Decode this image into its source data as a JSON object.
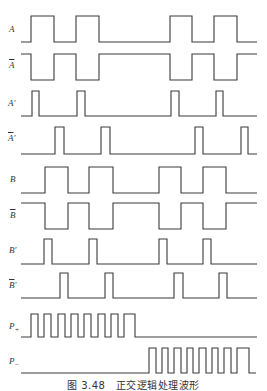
{
  "figure": {
    "caption": "图 3.48　正交逻辑处理波形",
    "stroke_color": "#3a3a3a",
    "background": "#ffffff"
  },
  "signals": [
    {
      "id": "A",
      "label": "A",
      "overline": false,
      "prime": "",
      "label_x": 9,
      "label_y": 25,
      "x_start": 21,
      "x_end": 257,
      "y_high": 16,
      "y_low": 42,
      "idle": "low",
      "pulses": [
        [
          31,
          54
        ],
        [
          76,
          99
        ],
        [
          170,
          192
        ],
        [
          214,
          237
        ]
      ]
    },
    {
      "id": "A_bar",
      "label": "A",
      "overline": true,
      "prime": "",
      "label_x": 9,
      "label_y": 61,
      "x_start": 21,
      "x_end": 257,
      "y_high": 54,
      "y_low": 80,
      "idle": "high",
      "pulses": [
        [
          31,
          54
        ],
        [
          76,
          99
        ],
        [
          170,
          192
        ],
        [
          214,
          237
        ]
      ]
    },
    {
      "id": "A_prime",
      "label": "A",
      "overline": false,
      "prime": "′",
      "label_x": 8,
      "label_y": 99,
      "x_start": 21,
      "x_end": 257,
      "y_high": 91,
      "y_low": 116,
      "idle": "low",
      "pulses": [
        [
          32,
          39
        ],
        [
          77,
          85
        ],
        [
          171,
          179
        ],
        [
          216,
          223
        ]
      ]
    },
    {
      "id": "A_bar_prime",
      "label": "A",
      "overline": true,
      "prime": "′",
      "label_x": 8,
      "label_y": 134,
      "x_start": 21,
      "x_end": 257,
      "y_high": 127,
      "y_low": 154,
      "idle": "low",
      "pulses": [
        [
          55,
          64
        ],
        [
          101,
          110
        ],
        [
          195,
          203
        ],
        [
          241,
          248
        ]
      ]
    },
    {
      "id": "B",
      "label": "B",
      "overline": false,
      "prime": "",
      "label_x": 10,
      "label_y": 175,
      "x_start": 21,
      "x_end": 257,
      "y_high": 167,
      "y_low": 193,
      "idle": "low",
      "pulses": [
        [
          45,
          68
        ],
        [
          89,
          113
        ],
        [
          159,
          181
        ],
        [
          203,
          226
        ]
      ]
    },
    {
      "id": "B_bar",
      "label": "B",
      "overline": true,
      "prime": "",
      "label_x": 10,
      "label_y": 211,
      "x_start": 21,
      "x_end": 257,
      "y_high": 203,
      "y_low": 229,
      "idle": "high",
      "pulses": [
        [
          45,
          68
        ],
        [
          89,
          113
        ],
        [
          159,
          181
        ],
        [
          203,
          226
        ]
      ]
    },
    {
      "id": "B_prime",
      "label": "B",
      "overline": false,
      "prime": "′",
      "label_x": 9,
      "label_y": 246,
      "x_start": 21,
      "x_end": 257,
      "y_high": 239,
      "y_low": 264,
      "idle": "low",
      "pulses": [
        [
          44,
          52
        ],
        [
          89,
          97
        ],
        [
          159,
          167
        ],
        [
          203,
          211
        ]
      ]
    },
    {
      "id": "B_bar_prime",
      "label": "B",
      "overline": true,
      "prime": "′",
      "label_x": 9,
      "label_y": 281,
      "x_start": 21,
      "x_end": 257,
      "y_high": 273,
      "y_low": 298,
      "idle": "low",
      "pulses": [
        [
          60,
          68
        ],
        [
          105,
          113
        ],
        [
          174,
          183
        ],
        [
          219,
          227
        ]
      ]
    },
    {
      "id": "P_plus",
      "label": "P",
      "overline": false,
      "prime": "",
      "sub": "+",
      "label_x": 9,
      "label_y": 322,
      "x_start": 21,
      "x_end": 257,
      "y_high": 314,
      "y_low": 337,
      "idle": "low",
      "pulses": [
        [
          31,
          38
        ],
        [
          44,
          51
        ],
        [
          58,
          65
        ],
        [
          71,
          78
        ],
        [
          84,
          91
        ],
        [
          98,
          105
        ],
        [
          111,
          118
        ],
        [
          124,
          135
        ]
      ]
    },
    {
      "id": "P_minus",
      "label": "P",
      "overline": false,
      "prime": "",
      "sub": "−",
      "label_x": 9,
      "label_y": 357,
      "x_start": 21,
      "x_end": 256,
      "y_high": 348,
      "y_low": 373,
      "idle": "low",
      "pulses": [
        [
          149,
          156
        ],
        [
          162,
          168
        ],
        [
          174,
          181
        ],
        [
          187,
          193
        ],
        [
          199,
          206
        ],
        [
          212,
          218
        ],
        [
          224,
          231
        ],
        [
          237,
          249
        ]
      ]
    }
  ]
}
